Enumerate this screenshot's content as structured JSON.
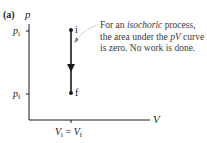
{
  "figure": {
    "panel_label": "(a)",
    "y_axis_label": "p",
    "x_axis_label": "V",
    "y_ticks": [
      {
        "symbol": "p",
        "subscript": "i",
        "position": "upper"
      },
      {
        "symbol": "p",
        "subscript": "f",
        "position": "lower"
      }
    ],
    "x_tick": {
      "left": "V",
      "left_sub": "i",
      "eq": "=",
      "right": "V",
      "right_sub": "f"
    },
    "points": [
      {
        "label": "i",
        "state": "initial"
      },
      {
        "label": "f",
        "state": "final"
      }
    ],
    "process_direction": "downward (i to f)",
    "annotation": {
      "prefix": "For an ",
      "emphasis": "isochoric",
      "middle": " process, the area under the ",
      "pv": "pV",
      "suffix": " curve is zero. No work is done."
    },
    "colors": {
      "line": "#1a1a1a",
      "annotation_text": "#3a3a3a",
      "leader": "#8a8a8a",
      "background": "#ffffff"
    }
  }
}
